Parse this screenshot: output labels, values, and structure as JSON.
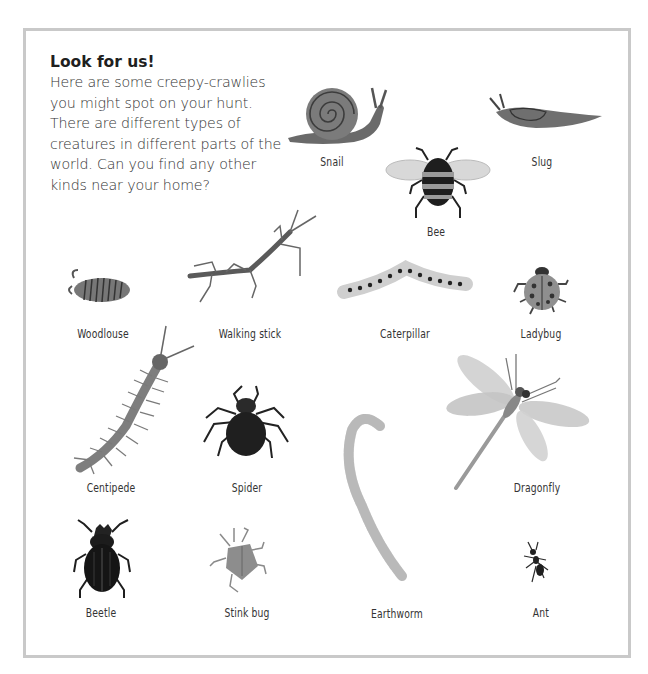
{
  "intro": {
    "heading": "Look for us!",
    "body": "Here are some creepy-crawlies you might spot on your hunt. There are different types of creatures in different parts of the world. Can you find any other kinds near your home?"
  },
  "creatures": {
    "snail": {
      "label": "Snail",
      "icon": "snail-icon"
    },
    "slug": {
      "label": "Slug",
      "icon": "slug-icon"
    },
    "bee": {
      "label": "Bee",
      "icon": "bee-icon"
    },
    "woodlouse": {
      "label": "Woodlouse",
      "icon": "woodlouse-icon"
    },
    "walking_stick": {
      "label": "Walking stick",
      "icon": "walking-stick-icon"
    },
    "caterpillar": {
      "label": "Caterpillar",
      "icon": "caterpillar-icon"
    },
    "ladybug": {
      "label": "Ladybug",
      "icon": "ladybug-icon"
    },
    "centipede": {
      "label": "Centipede",
      "icon": "centipede-icon"
    },
    "spider": {
      "label": "Spider",
      "icon": "spider-icon"
    },
    "earthworm": {
      "label": "Earthworm",
      "icon": "earthworm-icon"
    },
    "dragonfly": {
      "label": "Dragonfly",
      "icon": "dragonfly-icon"
    },
    "beetle": {
      "label": "Beetle",
      "icon": "beetle-icon"
    },
    "stink_bug": {
      "label": "Stink bug",
      "icon": "stink-bug-icon"
    },
    "ant": {
      "label": "Ant",
      "icon": "ant-icon"
    }
  },
  "colors": {
    "frame": "#c9c9c9",
    "text": "#333333"
  }
}
